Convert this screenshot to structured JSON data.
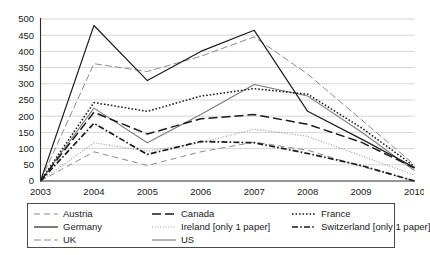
{
  "chart_data": {
    "type": "line",
    "title": "",
    "subtitle": "",
    "xlabel": "",
    "ylabel": "",
    "categories": [
      "2003",
      "2004",
      "2005",
      "2006",
      "2007",
      "2008",
      "2009",
      "2010"
    ],
    "x": [
      2003,
      2004,
      2005,
      2006,
      2007,
      2008,
      2009,
      2010
    ],
    "ylim": [
      0,
      500
    ],
    "ytick_values": [
      0,
      50,
      100,
      150,
      200,
      250,
      300,
      350,
      400,
      450,
      500
    ],
    "ytick_labels": [
      "0",
      "50",
      "100",
      "150",
      "200",
      "250",
      "300",
      "350",
      "400",
      "450",
      "500"
    ],
    "grid": true,
    "grid_axis": "y",
    "legend_position": "bottom",
    "legend_columns": 3,
    "series": [
      {
        "name": "Austria",
        "style": "dashed",
        "color": "#8c8c8c",
        "values": [
          0,
          90,
          48,
          90,
          120,
          95,
          45,
          0
        ]
      },
      {
        "name": "Canada",
        "style": "long-dash",
        "color": "#1a1a1a",
        "values": [
          0,
          212,
          145,
          192,
          205,
          175,
          120,
          40
        ]
      },
      {
        "name": "France",
        "style": "dotted",
        "color": "#1a1a1a",
        "values": [
          0,
          242,
          215,
          262,
          285,
          268,
          165,
          45
        ]
      },
      {
        "name": "Germany",
        "style": "solid",
        "color": "#1a1a1a",
        "values": [
          0,
          480,
          310,
          400,
          465,
          215,
          130,
          42
        ]
      },
      {
        "name": "Ireland [only 1 paper]",
        "style": "fine-dotted",
        "color": "#9a9a9a",
        "values": [
          0,
          118,
          92,
          118,
          160,
          138,
          78,
          18
        ]
      },
      {
        "name": "Switzerland [only 1 paper]",
        "style": "dash-dot",
        "color": "#1a1a1a",
        "values": [
          0,
          178,
          82,
          122,
          118,
          85,
          48,
          0
        ]
      },
      {
        "name": "UK",
        "style": "medium-dash",
        "color": "#8c8c8c",
        "values": [
          0,
          362,
          338,
          385,
          445,
          330,
          190,
          50
        ]
      },
      {
        "name": "US",
        "style": "solid-gray",
        "color": "#7a7a7a",
        "values": [
          0,
          225,
          118,
          205,
          298,
          262,
          152,
          32
        ]
      }
    ]
  },
  "legend": {
    "entries": [
      {
        "label": "Austria"
      },
      {
        "label": "Canada"
      },
      {
        "label": "France"
      },
      {
        "label": "Germany"
      },
      {
        "label": "Ireland [only 1 paper]"
      },
      {
        "label": "Switzerland [only 1 paper]"
      },
      {
        "label": "UK"
      },
      {
        "label": "US"
      }
    ]
  }
}
